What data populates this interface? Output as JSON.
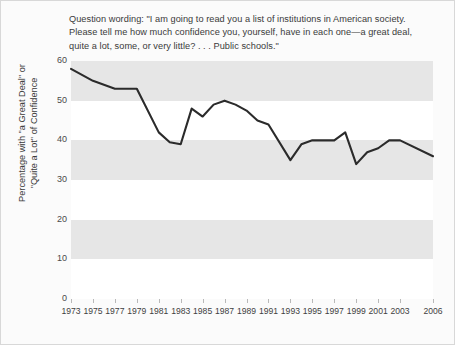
{
  "note": {
    "text": "Question wording: \"I am going to read you a list of institutions in American society.\nPlease tell me how much confidence you, yourself, have in each one—a great deal,\nquite a lot, some, or very little? . . . Public schools.\""
  },
  "axis": {
    "ylabel": "Percentage with \"a Great Deal\" or\n\"Quite a Lot\" of Confidence",
    "yticks": [
      "0",
      "10",
      "20",
      "30",
      "40",
      "50",
      "60"
    ]
  },
  "colors": {
    "line": "#2b2b2b",
    "plot_background": "#e6e6e6",
    "band": "#ffffff",
    "text": "#3a3a3a",
    "frame": "#d8d8d8"
  },
  "chart_data": {
    "type": "line",
    "title": "",
    "xlabel": "",
    "ylabel": "Percentage with \"a Great Deal\" or \"Quite a Lot\" of Confidence",
    "ylim": [
      0,
      60
    ],
    "xlim": [
      1973,
      2006
    ],
    "grid": "horizontal-bands",
    "legend": "none",
    "tick_labels_x": [
      "1973",
      "1975",
      "1977",
      "1979",
      "1981",
      "1983",
      "1985",
      "1987",
      "1989",
      "1991",
      "1993",
      "1995",
      "1997",
      "1999",
      "2001",
      "2003",
      "2006"
    ],
    "tick_labels_y": [
      "0",
      "10",
      "20",
      "30",
      "40",
      "50",
      "60"
    ],
    "x": [
      1973,
      1975,
      1977,
      1979,
      1981,
      1982,
      1983,
      1984,
      1985,
      1986,
      1987,
      1988,
      1989,
      1990,
      1991,
      1993,
      1994,
      1995,
      1996,
      1997,
      1998,
      1999,
      2000,
      2001,
      2002,
      2003,
      2006
    ],
    "values": [
      58,
      55,
      53,
      53,
      42,
      39.5,
      39,
      48,
      46,
      49,
      50,
      49,
      47.5,
      45,
      44,
      35,
      39,
      40,
      40,
      40,
      42,
      34,
      37,
      38,
      40,
      40,
      36
    ]
  }
}
